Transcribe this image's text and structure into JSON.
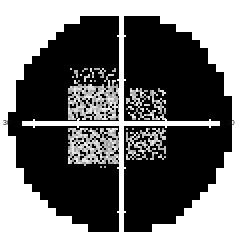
{
  "plot": {
    "type": "visual-field-grayscale",
    "title": "",
    "background_color": "#ffffff",
    "field_color": "#000000",
    "axis_color": "#ffffff",
    "center": {
      "x": 121,
      "y": 123
    },
    "radius_px": 110,
    "block_px": 8,
    "axes": {
      "horizontal": {
        "left_label": "30",
        "right_label": "30",
        "tick_offsets_px": [
          -88,
          -44,
          44,
          88
        ]
      },
      "vertical": {
        "top_label": "",
        "bottom_label": "",
        "tick_offsets_px": [
          -110,
          -88,
          -44,
          44,
          88,
          110
        ]
      }
    },
    "defect_patches": [
      {
        "name": "superior-nasal-patch",
        "x": 70,
        "y": 68,
        "w": 48,
        "h": 26,
        "level": 2
      },
      {
        "name": "superior-paracentral-patch",
        "x": 68,
        "y": 86,
        "w": 52,
        "h": 34,
        "level": 4
      },
      {
        "name": "superior-temporal-patch",
        "x": 126,
        "y": 88,
        "w": 40,
        "h": 32,
        "level": 3
      },
      {
        "name": "inferior-nasal-patch",
        "x": 68,
        "y": 128,
        "w": 52,
        "h": 36,
        "level": 4
      },
      {
        "name": "inferior-temporal-patch",
        "x": 126,
        "y": 128,
        "w": 40,
        "h": 32,
        "level": 3
      },
      {
        "name": "inferior-outer-patch",
        "x": 70,
        "y": 160,
        "w": 44,
        "h": 12,
        "level": 1
      }
    ],
    "gray_levels": [
      {
        "level": 1,
        "density": 0.1
      },
      {
        "level": 2,
        "density": 0.28
      },
      {
        "level": 3,
        "density": 0.5
      },
      {
        "level": 4,
        "density": 0.72
      }
    ]
  },
  "chart_data": {
    "type": "heatmap",
    "title": "",
    "xlabel": "",
    "ylabel": "",
    "xlim": [
      -30,
      30
    ],
    "ylim": [
      -30,
      30
    ],
    "grid": false,
    "legend": "none",
    "tick_labels_x": [
      "30",
      "30"
    ],
    "tick_labels_y": []
  }
}
